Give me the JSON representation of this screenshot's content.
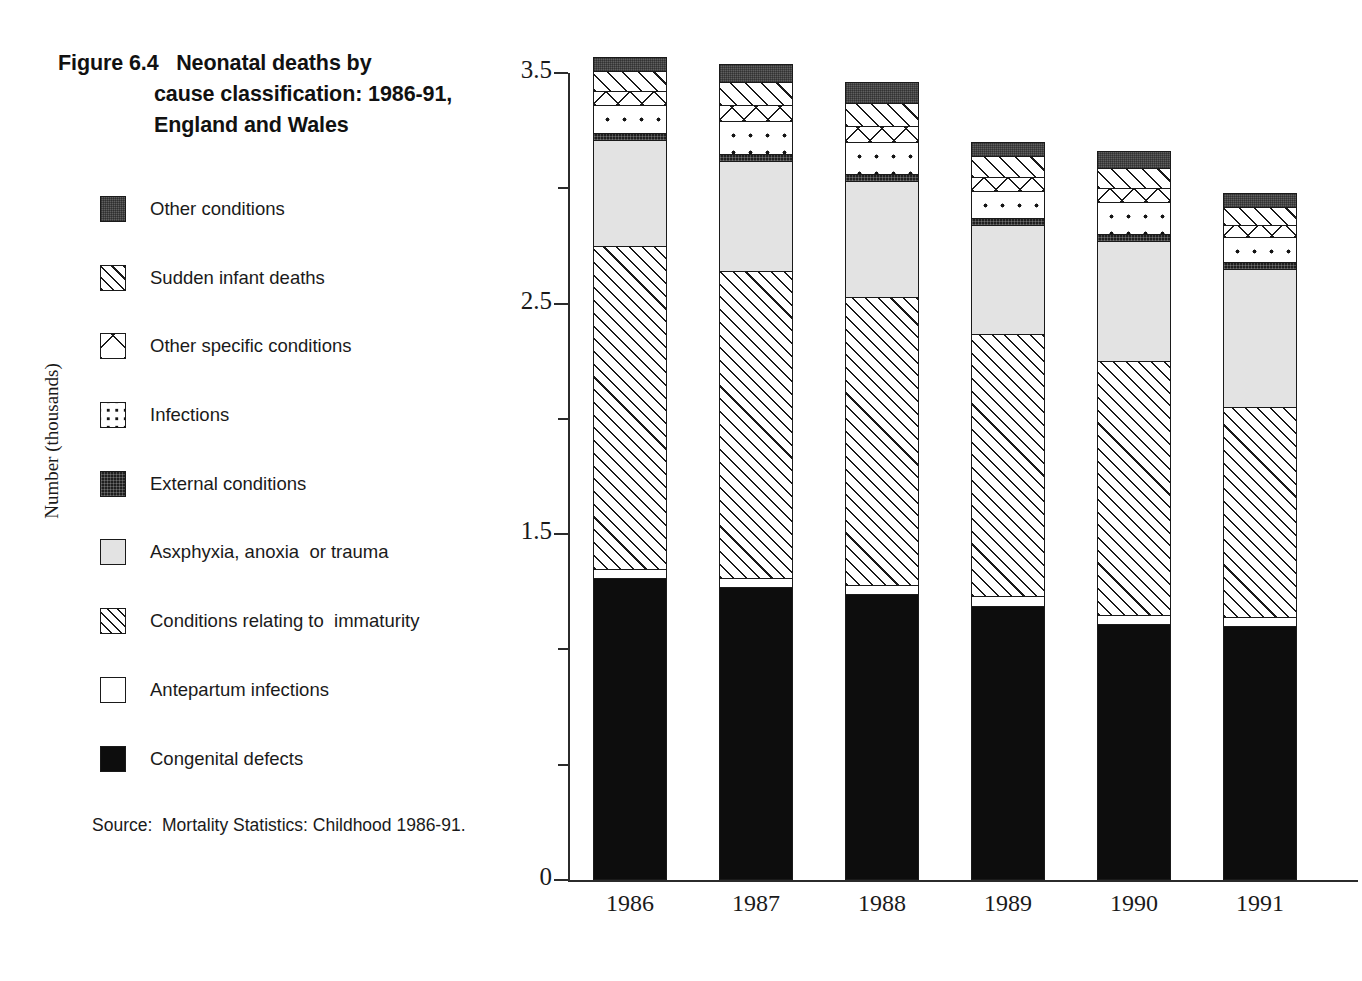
{
  "figure": {
    "title_lines": [
      "Figure 6.4   Neonatal deaths by",
      "cause classification: 1986-91,",
      "England and Wales"
    ],
    "source": "Source:  Mortality Statistics: Childhood 1986-91."
  },
  "legend": {
    "items": [
      {
        "label": "Other conditions",
        "pattern": "pat-darkgray"
      },
      {
        "label": "Sudden infant deaths",
        "pattern": "pat-diag-wide"
      },
      {
        "label": "Other specific conditions",
        "pattern": "pat-cross"
      },
      {
        "label": "Infections",
        "pattern": "pat-dots"
      },
      {
        "label": "External conditions",
        "pattern": "pat-external"
      },
      {
        "label": "Asxphyxia, anoxia  or trauma",
        "pattern": "pat-lightgray"
      },
      {
        "label": "Conditions relating to  immaturity",
        "pattern": "pat-diag-narrow"
      },
      {
        "label": "Antepartum infections",
        "pattern": "pat-white"
      },
      {
        "label": "Congenital defects",
        "pattern": "pat-solid-black"
      }
    ]
  },
  "axes": {
    "y_title": "Number (thousands)",
    "y_major_ticks": [
      "0",
      "1.5",
      "2.5",
      "3.5"
    ],
    "y_major_values": [
      0,
      1.5,
      2.5,
      3.5
    ],
    "y_minor_values": [
      0.5,
      1.0,
      2.0,
      3.0
    ],
    "y_min": 0,
    "y_max": 3.5,
    "x_tick_labels": [
      "1986",
      "1987",
      "1988",
      "1989",
      "1990",
      "1991"
    ]
  },
  "chart_data": {
    "type": "bar",
    "stacked": true,
    "title": "Figure 6.4   Neonatal deaths by cause classification: 1986-91, England and Wales",
    "xlabel": "",
    "ylabel": "Number (thousands)",
    "ylim": [
      0,
      3.5
    ],
    "grid": false,
    "legend_position": "left",
    "units": "thousands",
    "categories": [
      "1986",
      "1987",
      "1988",
      "1989",
      "1990",
      "1991"
    ],
    "series": [
      {
        "name": "Congenital defects",
        "pattern": "pat-solid-black",
        "values": [
          1.31,
          1.27,
          1.24,
          1.19,
          1.11,
          1.1
        ]
      },
      {
        "name": "Antepartum infections",
        "pattern": "pat-white",
        "values": [
          0.04,
          0.04,
          0.04,
          0.04,
          0.04,
          0.04
        ]
      },
      {
        "name": "Conditions relating to  immaturity",
        "pattern": "pat-diag-narrow",
        "values": [
          1.4,
          1.33,
          1.25,
          1.14,
          1.1,
          0.91
        ]
      },
      {
        "name": "Asxphyxia, anoxia  or trauma",
        "pattern": "pat-lightgray",
        "values": [
          0.46,
          0.48,
          0.5,
          0.47,
          0.52,
          0.6
        ]
      },
      {
        "name": "External conditions",
        "pattern": "pat-external",
        "values": [
          0.03,
          0.03,
          0.03,
          0.03,
          0.03,
          0.03
        ]
      },
      {
        "name": "Infections",
        "pattern": "pat-dots",
        "values": [
          0.12,
          0.14,
          0.14,
          0.12,
          0.14,
          0.11
        ]
      },
      {
        "name": "Other specific conditions",
        "pattern": "pat-cross",
        "values": [
          0.06,
          0.07,
          0.07,
          0.06,
          0.06,
          0.05
        ]
      },
      {
        "name": "Sudden infant deaths",
        "pattern": "pat-diag-wide",
        "values": [
          0.09,
          0.1,
          0.1,
          0.09,
          0.09,
          0.08
        ]
      },
      {
        "name": "Other conditions",
        "pattern": "pat-darkgray",
        "values": [
          0.06,
          0.08,
          0.09,
          0.06,
          0.07,
          0.06
        ]
      }
    ],
    "totals": [
      3.49,
      3.44,
      3.42,
      3.2,
      3.16,
      2.98
    ]
  },
  "plot_geometry": {
    "x0": 568,
    "y_zero_px": 880,
    "y_top_px": 73,
    "bar_width": 74,
    "bar_pitch": 126,
    "first_bar_left": 593
  }
}
